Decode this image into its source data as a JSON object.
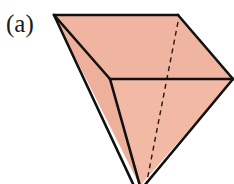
{
  "panel": {
    "label": "(a)"
  },
  "figure": {
    "type": "polyhedron-sketch",
    "fill_color": "#f0b5a0",
    "edge_color": "#111111",
    "vertices": {
      "top_left": [
        54,
        15
      ],
      "top_right": [
        178,
        15
      ],
      "right": [
        233,
        79
      ],
      "front_mid": [
        110,
        79
      ],
      "apex": [
        140,
        186
      ]
    },
    "hidden_edge": {
      "from": [
        178,
        22
      ],
      "to": [
        146,
        186
      ],
      "style": "dashed"
    }
  }
}
